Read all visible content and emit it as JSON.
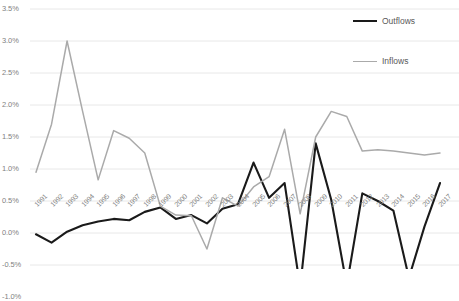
{
  "chart_data": {
    "type": "line",
    "title": "",
    "xlabel": "",
    "ylabel": "",
    "ylim": [
      -1.0,
      3.5
    ],
    "ytick_labels": [
      "3.5%",
      "3.0%",
      "2.5%",
      "2.0%",
      "1.5%",
      "1.0%",
      "0.5%",
      "0.0%",
      "-0.5%",
      "-1.0%"
    ],
    "ytick_values": [
      3.5,
      3.0,
      2.5,
      2.0,
      1.5,
      1.0,
      0.5,
      0.0,
      -0.5,
      -1.0
    ],
    "grid": true,
    "legend_position": "top-right",
    "categories": [
      "1991",
      "1992",
      "1993",
      "1994",
      "1995",
      "1996",
      "1997",
      "1998",
      "1999",
      "2000",
      "2001",
      "2002",
      "2003",
      "2004",
      "2005",
      "2006",
      "2007",
      "2008",
      "2009",
      "2010",
      "2011",
      "2012",
      "2013",
      "2014",
      "2015",
      "2016",
      "2017"
    ],
    "series": [
      {
        "name": "Outflows",
        "color": "#1a1a1a",
        "values": [
          -0.02,
          -0.15,
          0.02,
          0.12,
          0.18,
          0.22,
          0.2,
          0.33,
          0.4,
          0.22,
          0.28,
          0.15,
          0.38,
          0.45,
          1.1,
          0.55,
          0.78,
          -0.85,
          1.4,
          0.52,
          -0.82,
          0.62,
          0.5,
          0.35,
          -0.7,
          0.1,
          0.78
        ]
      },
      {
        "name": "Inflows",
        "color": "#aaaaaa",
        "values": [
          0.95,
          1.7,
          3.0,
          1.9,
          0.83,
          1.6,
          1.48,
          1.25,
          0.42,
          0.28,
          0.27,
          -0.25,
          0.55,
          0.42,
          0.72,
          0.88,
          1.62,
          0.3,
          1.5,
          1.9,
          1.82,
          1.28,
          1.3,
          1.28,
          1.25,
          1.22,
          1.25
        ]
      }
    ]
  },
  "legend": {
    "items": [
      {
        "label": "Outflows",
        "color": "#1a1a1a",
        "width": 2.4
      },
      {
        "label": "Inflows",
        "color": "#aaaaaa",
        "width": 1.6
      }
    ]
  }
}
